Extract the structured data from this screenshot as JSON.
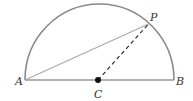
{
  "diagram": {
    "type": "semicircle-geometry",
    "points": {
      "A": {
        "label": "A"
      },
      "B": {
        "label": "B"
      },
      "C": {
        "label": "C"
      },
      "P": {
        "label": "P"
      }
    },
    "segments": [
      {
        "from": "A",
        "to": "B",
        "style": "solid",
        "description": "diameter"
      },
      {
        "from": "A",
        "to": "P",
        "style": "solid",
        "description": "chord"
      },
      {
        "from": "C",
        "to": "P",
        "style": "dashed",
        "description": "radius"
      }
    ],
    "arcs": [
      {
        "from": "A",
        "to": "B",
        "center": "C",
        "style": "solid",
        "description": "upper semicircle"
      }
    ],
    "colors": {
      "line": "#999999",
      "arc": "#8a8a8a",
      "dashed": "#222222",
      "center_dot": "#111111",
      "label": "#333333"
    }
  }
}
